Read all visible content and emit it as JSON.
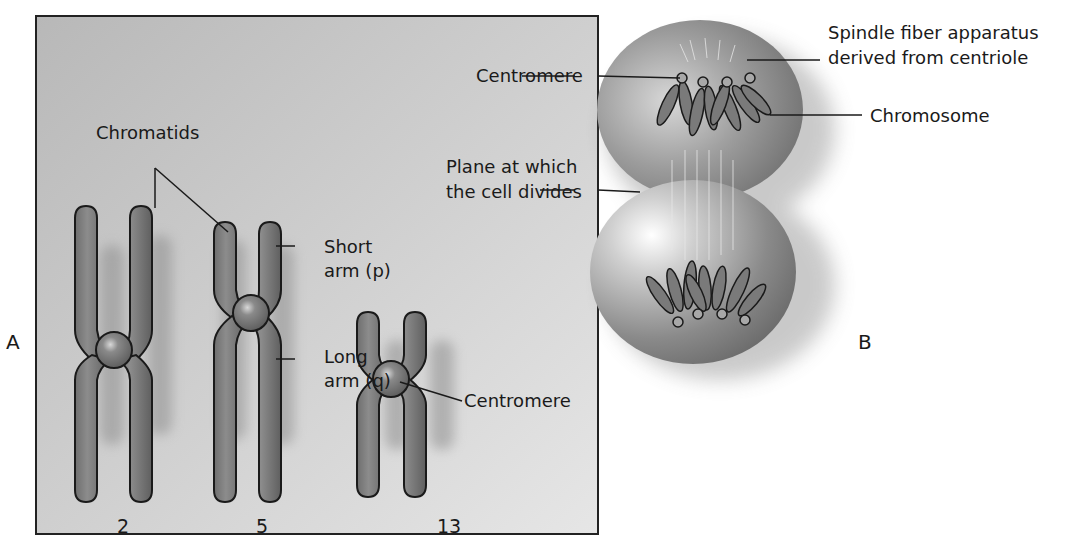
{
  "panel_a": {
    "letter": "A",
    "labels": {
      "chromatids": "Chromatids",
      "short_arm_line1": "Short",
      "short_arm_line2": "arm (p)",
      "long_arm_line1": "Long",
      "long_arm_line2": "arm (q)",
      "centromere": "Centromere"
    },
    "chromosome_numbers": [
      "2",
      "5",
      "13"
    ]
  },
  "panel_b": {
    "letter": "B",
    "labels": {
      "centromere": "Centromere",
      "spindle_line1": "Spindle fiber apparatus",
      "spindle_line2": "derived from centriole",
      "chromosome": "Chromosome",
      "plane_line1": "Plane at which",
      "plane_line2": "the cell divides"
    }
  },
  "colors": {
    "panel_background": "#c9c9c9",
    "chromosome_fill": "#7a7a7a",
    "outline": "#1a1a1a",
    "cell_fill": "#9a9a9a"
  }
}
